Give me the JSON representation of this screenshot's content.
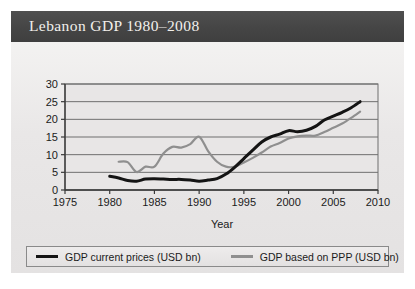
{
  "figure": {
    "title": "Lebanon GDP 1980–2008",
    "title_bar_color": "#454545",
    "title_text_color": "#f2f0ec",
    "panel_color": "#eceaea",
    "page_color": "#ffffff"
  },
  "legend": {
    "position": "below-plot",
    "border_color": "#8a8a8a",
    "entries": [
      {
        "label": "GDP current prices (USD bn)",
        "color": "#141414",
        "swatch": "line-swatch"
      },
      {
        "label": "GDP based on PPP (USD bn)",
        "color": "#8f8f8f",
        "swatch": "line-swatch"
      }
    ]
  },
  "chart_data": {
    "type": "line",
    "title": "Lebanon GDP 1980–2008",
    "xlabel": "Year",
    "ylabel": "",
    "xlim": [
      1975,
      2010
    ],
    "ylim": [
      0,
      30
    ],
    "xticks": [
      1975,
      1980,
      1985,
      1990,
      1995,
      2000,
      2005,
      2010
    ],
    "yticks": [
      0,
      5,
      10,
      15,
      20,
      25,
      30
    ],
    "grid": "horizontal",
    "legend_position": "bottom",
    "x": [
      1980,
      1981,
      1982,
      1983,
      1984,
      1985,
      1986,
      1987,
      1988,
      1989,
      1990,
      1991,
      1992,
      1993,
      1994,
      1995,
      1996,
      1997,
      1998,
      1999,
      2000,
      2001,
      2002,
      2003,
      2004,
      2005,
      2006,
      2007,
      2008
    ],
    "series": [
      {
        "name": "GDP current prices (USD bn)",
        "color": "#141414",
        "values": [
          3.9,
          3.4,
          2.7,
          2.5,
          3.1,
          3.2,
          3.1,
          3.0,
          3.0,
          2.8,
          2.5,
          2.8,
          3.2,
          4.5,
          6.5,
          8.9,
          11.3,
          13.6,
          15.0,
          15.8,
          16.8,
          16.5,
          16.9,
          18.0,
          19.8,
          20.9,
          22.0,
          23.3,
          25.0
        ]
      },
      {
        "name": "GDP based on PPP (USD bn)",
        "color": "#8f8f8f",
        "values": [
          null,
          8.0,
          7.9,
          5.1,
          6.6,
          6.6,
          10.3,
          12.2,
          12.0,
          13.0,
          15.1,
          11.0,
          8.0,
          6.6,
          6.6,
          7.8,
          9.1,
          10.6,
          12.3,
          13.3,
          14.6,
          15.2,
          15.4,
          15.4,
          16.4,
          17.6,
          18.8,
          20.4,
          22.2
        ]
      }
    ]
  },
  "axes": {
    "x_tick_labels": [
      "1975",
      "1980",
      "1985",
      "1990",
      "1995",
      "2000",
      "2005",
      "2010"
    ],
    "y_tick_labels": [
      "0",
      "5",
      "10",
      "15",
      "20",
      "25",
      "30"
    ],
    "x_axis_title": "Year"
  }
}
